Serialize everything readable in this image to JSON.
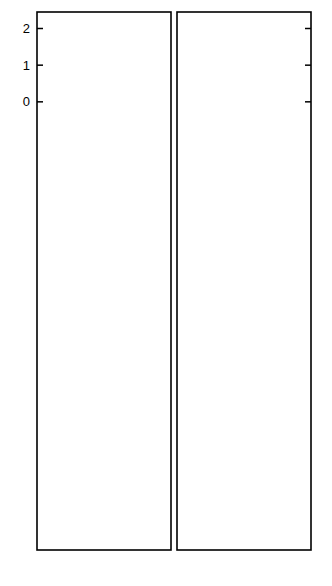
{
  "figure": {
    "ylabel": "log ν",
    "xlabel": "R",
    "background": "#ffffff",
    "ink": "#000000"
  },
  "axes": {
    "x_ticks": [
      0,
      5,
      10,
      15
    ],
    "x_tick_labels": [
      "0",
      "5",
      "10",
      "15"
    ],
    "x_range": [
      0,
      17.5
    ],
    "left_y_tick_labels_by_panel": [
      [
        "2",
        "1",
        "0"
      ],
      [
        "1",
        "0"
      ],
      [
        "1",
        "0",
        "-1"
      ],
      [
        "1",
        "0",
        "-1",
        "-2"
      ],
      [
        "0",
        "-1",
        "-2"
      ]
    ]
  },
  "legend": {
    "left_markers": [
      "filled-circle",
      "cross"
    ],
    "right_markers": [
      "star",
      "open-circle",
      "filled-square"
    ]
  },
  "chart_data": {
    "type": "scatter",
    "title": "",
    "xlabel": "R",
    "ylabel": "log ν",
    "grid": false,
    "legend_position": "none",
    "xlim": [
      0,
      17.5
    ],
    "panels": [
      {
        "label": "Z = 1",
        "ylim": [
          -0.55,
          2.45
        ],
        "yticks": [
          0,
          1,
          2
        ],
        "left": {
          "series": [
            {
              "name": "filled-circle",
              "marker": "filled-circle",
              "x": [
                1.0,
                2.6,
                4.3,
                5.3,
                6.3,
                7.2,
                8.2,
                9.3,
                10.4,
                11.4,
                12.6,
                14.9
              ],
              "y": [
                1.35,
                1.24,
                1.57,
                1.33,
                1.22,
                1.02,
                0.93,
                0.7,
                0.07,
                0.0,
                0.0,
                0.63
              ]
            },
            {
              "name": "cross",
              "marker": "cross",
              "x": [
                0.2,
                2.6,
                4.3,
                5.8,
                6.6,
                7.6,
                9.3,
                10.6,
                12.1,
                14.9
              ],
              "y": [
                2.03,
                1.21,
                1.77,
                2.15,
                1.97,
                2.3,
                1.47,
                0.85,
                1.17,
                0.78
              ]
            }
          ]
        },
        "right": {
          "series": [
            {
              "name": "star",
              "marker": "star",
              "x": [
                3.0,
                4.2,
                5.3,
                6.2,
                6.9,
                7.6,
                8.6,
                10.4,
                12.4,
                14.6
              ],
              "y": [
                1.27,
                1.62,
                1.53,
                1.72,
                1.45,
                1.31,
                1.26,
                0.98,
                0.95,
                0.72
              ]
            },
            {
              "name": "open-circle",
              "marker": "open-circle",
              "x": [
                2.4,
                3.4,
                4.6,
                5.6,
                6.2,
                7.1,
                8.6,
                10.2,
                11.4,
                14.3
              ],
              "y": [
                0.78,
                1.16,
                1.53,
                1.2,
                1.41,
                1.28,
                0.95,
                0.6,
                0.7,
                0.38
              ]
            },
            {
              "name": "filled-square",
              "marker": "filled-square",
              "x": [
                2.6,
                4.0,
                4.6,
                5.3,
                6.2,
                7.1,
                8.3,
                9.6,
                10.4,
                14.3
              ],
              "y": [
                0.0,
                0.35,
                1.07,
                0.85,
                1.15,
                1.3,
                0.83,
                0.72,
                0.8,
                0.1
              ]
            }
          ]
        }
      },
      {
        "label": "Z = 3",
        "ylim": [
          -0.55,
          1.75
        ],
        "yticks": [
          0,
          1
        ],
        "left": {
          "series": [
            {
              "name": "filled-circle",
              "marker": "filled-circle",
              "x": [
                1.3,
                3.4,
                6.2,
                7.4,
                8.4,
                9.9,
                12.9
              ],
              "y": [
                1.05,
                0.97,
                0.47,
                0.25,
                0.07,
                0.04,
                0.12
              ]
            },
            {
              "name": "cross",
              "marker": "cross",
              "x": [
                1.3,
                3.1,
                4.8,
                7.0,
                8.2,
                9.9,
                13.0
              ],
              "y": [
                1.2,
                1.32,
                1.55,
                0.92,
                0.84,
                -0.07,
                0.41
              ]
            }
          ]
        },
        "right": {
          "series": [
            {
              "name": "star",
              "marker": "star",
              "x": [
                2.0,
                4.3,
                5.9,
                7.8,
                8.5,
                12.8
              ],
              "y": [
                0.86,
                1.15,
                1.3,
                0.72,
                0.55,
                0.11
              ]
            },
            {
              "name": "open-circle",
              "marker": "open-circle",
              "x": [
                1.9,
                4.2,
                5.9,
                7.9,
                8.6,
                12.9
              ],
              "y": [
                0.4,
                0.73,
                0.87,
                0.42,
                0.37,
                -0.3
              ]
            },
            {
              "name": "filled-square",
              "marker": "filled-square",
              "x": [
                1.9,
                4.3,
                6.3,
                7.8,
                9.1,
                9.9,
                12.8
              ],
              "y": [
                0.0,
                0.3,
                0.55,
                0.0,
                -0.2,
                -0.18,
                -0.17
              ]
            }
          ]
        }
      },
      {
        "label": "Z = 5",
        "ylim": [
          -1.6,
          1.4
        ],
        "yticks": [
          -1,
          0,
          1
        ],
        "left": {
          "series": [
            {
              "name": "filled-circle",
              "marker": "filled-circle",
              "x": [
                1.0,
                3.3,
                5.0,
                6.8,
                8.4,
                11.3
              ],
              "y": [
                0.35,
                0.34,
                0.27,
                0.14,
                0.1,
                -0.4
              ]
            },
            {
              "name": "cross",
              "marker": "cross",
              "x": [
                1.2,
                3.3,
                5.1,
                6.7,
                8.4,
                11.2
              ],
              "y": [
                0.68,
                0.53,
                0.03,
                0.25,
                0.56,
                0.3
              ]
            }
          ]
        },
        "right": {
          "series": [
            {
              "name": "star",
              "marker": "star",
              "x": [
                1.6,
                4.0,
                5.8,
                7.5,
                10.0,
                13.7
              ],
              "y": [
                0.72,
                0.55,
                0.25,
                0.25,
                0.58,
                0.27
              ]
            },
            {
              "name": "open-circle",
              "marker": "open-circle",
              "x": [
                1.6,
                4.0,
                6.6,
                8.3,
                10.2,
                13.7
              ],
              "y": [
                0.22,
                0.22,
                -0.5,
                -0.18,
                0.0,
                0.1
              ]
            },
            {
              "name": "filled-square",
              "marker": "filled-square",
              "x": [
                1.6,
                3.8,
                6.4,
                10.0,
                13.4
              ],
              "y": [
                -0.33,
                -0.72,
                -0.26,
                -0.7,
                -1.18
              ]
            }
          ]
        }
      },
      {
        "label": "Z = 7",
        "ylim": [
          -2.4,
          1.5
        ],
        "yticks": [
          -2,
          -1,
          0,
          1
        ],
        "left": {
          "series": [
            {
              "name": "filled-circle",
              "marker": "filled-circle",
              "x": [
                2.5,
                4.8,
                7.4,
                9.9
              ],
              "y": [
                -0.08,
                -0.2,
                -0.3,
                -0.37
              ]
            },
            {
              "name": "cross",
              "marker": "cross",
              "x": [
                2.4,
                4.2,
                5.7,
                7.4,
                9.9
              ],
              "y": [
                0.62,
                0.22,
                -0.37,
                0.03,
                0.0
              ]
            }
          ]
        },
        "right": {
          "series": [
            {
              "name": "star",
              "marker": "star",
              "x": [
                3.1,
                4.9,
                6.4,
                8.5
              ],
              "y": [
                0.53,
                0.12,
                -0.22,
                -0.1
              ]
            },
            {
              "name": "open-circle",
              "marker": "open-circle",
              "x": [
                3.0,
                5.0,
                6.4,
                8.6,
                12.0
              ],
              "y": [
                0.08,
                -0.37,
                -0.3,
                -0.7,
                -1.05
              ]
            },
            {
              "name": "filled-square",
              "marker": "filled-square",
              "x": [
                3.0,
                5.1,
                6.8,
                8.6,
                11.0
              ],
              "y": [
                -0.5,
                -0.95,
                -1.95,
                -1.05,
                -0.38
              ]
            }
          ]
        }
      },
      {
        "label": "Z = 9",
        "ylim": [
          -2.15,
          0.55
        ],
        "yticks": [
          -2,
          -1,
          0
        ],
        "left": {
          "series": [
            {
              "name": "filled-circle",
              "marker": "filled-circle",
              "x": [
                6.0,
                10.0,
                14.0
              ],
              "y": [
                0.1,
                0.05,
                -0.8
              ]
            },
            {
              "name": "cross",
              "marker": "cross",
              "x": [
                6.0,
                10.0,
                14.0
              ],
              "y": [
                -0.3,
                -0.67,
                -0.82
              ]
            }
          ]
        },
        "right": {
          "series": [
            {
              "name": "star",
              "marker": "star",
              "x": [
                10.0,
                14.0
              ],
              "y": [
                -0.12,
                -1.1
              ]
            },
            {
              "name": "open-circle",
              "marker": "open-circle",
              "x": [
                10.0,
                14.0
              ],
              "y": [
                -0.14,
                -1.72
              ]
            },
            {
              "name": "filled-square",
              "marker": "filled-square",
              "x": [
                6.0,
                8.0,
                14.0
              ],
              "y": [
                -0.18,
                -1.85,
                -1.9
              ]
            }
          ]
        }
      }
    ]
  }
}
